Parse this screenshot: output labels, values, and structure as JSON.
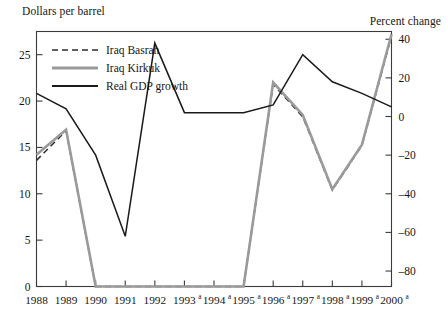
{
  "axis_titles": {
    "left": "Dollars per barrel",
    "right": "Percent change"
  },
  "legend": [
    {
      "label": "Iraq Basrah",
      "style": "dashed",
      "color": "#2b2b2b"
    },
    {
      "label": "Iraq Kirkuk",
      "style": "solid",
      "color": "#9a9a9a"
    },
    {
      "label": "Real GDP growth",
      "style": "solid",
      "color": "#1a1a1a"
    }
  ],
  "colors": {
    "basrah": "#2b2b2b",
    "kirkuk": "#9a9a9a",
    "gdp": "#1a1a1a",
    "axis": "#3b3b3b",
    "background": "#ffffff"
  },
  "axes": {
    "left_ticks": [
      "0",
      "5",
      "10",
      "15",
      "20",
      "25"
    ],
    "right_ticks": [
      "-80",
      "-60",
      "-40",
      "-20",
      "0",
      "20",
      "40"
    ],
    "x_ticks": [
      {
        "year": "1988",
        "sup": ""
      },
      {
        "year": "1989",
        "sup": ""
      },
      {
        "year": "1990",
        "sup": ""
      },
      {
        "year": "1991",
        "sup": ""
      },
      {
        "year": "1992",
        "sup": ""
      },
      {
        "year": "1993",
        "sup": "a"
      },
      {
        "year": "1994",
        "sup": "a"
      },
      {
        "year": "1995",
        "sup": "a"
      },
      {
        "year": "1996",
        "sup": "a"
      },
      {
        "year": "1997",
        "sup": "a"
      },
      {
        "year": "1998",
        "sup": "a"
      },
      {
        "year": "1999",
        "sup": "a"
      },
      {
        "year": "2000",
        "sup": "a"
      }
    ]
  },
  "chart_data": {
    "type": "line",
    "title": "",
    "xlabel": "",
    "ylabel": "Dollars per barrel",
    "y2label": "Percent change",
    "grid": false,
    "legend_position": "top-left",
    "categories": [
      "1988",
      "1989",
      "1990",
      "1991",
      "1992",
      "1993",
      "1994",
      "1995",
      "1996",
      "1997",
      "1998",
      "1999",
      "2000"
    ],
    "ylim": [
      0,
      27.5
    ],
    "y2lim": [
      -88,
      44
    ],
    "yticks": [
      0,
      5,
      10,
      15,
      20,
      25
    ],
    "y2ticks": [
      -80,
      -60,
      -40,
      -20,
      0,
      20,
      40
    ],
    "series": [
      {
        "name": "Iraq Basrah",
        "axis": "left",
        "unit": "Dollars per barrel",
        "style": "dashed",
        "color": "#2b2b2b",
        "values": [
          13.6,
          16.8,
          0,
          0,
          0,
          0,
          0,
          0,
          21.8,
          18.3,
          10.4,
          15.2,
          27.0
        ]
      },
      {
        "name": "Iraq Kirkuk",
        "axis": "left",
        "unit": "Dollars per barrel",
        "style": "solid",
        "color": "#9a9a9a",
        "values": [
          14.2,
          16.9,
          0,
          0,
          0,
          0,
          0,
          0,
          22.0,
          18.5,
          10.5,
          15.3,
          27.2
        ]
      },
      {
        "name": "Real GDP growth",
        "axis": "right",
        "unit": "Percent change",
        "style": "solid",
        "color": "#1a1a1a",
        "values": [
          12,
          4,
          -20,
          -62,
          38,
          2,
          2,
          2,
          6,
          32,
          18,
          12,
          5
        ]
      }
    ]
  }
}
